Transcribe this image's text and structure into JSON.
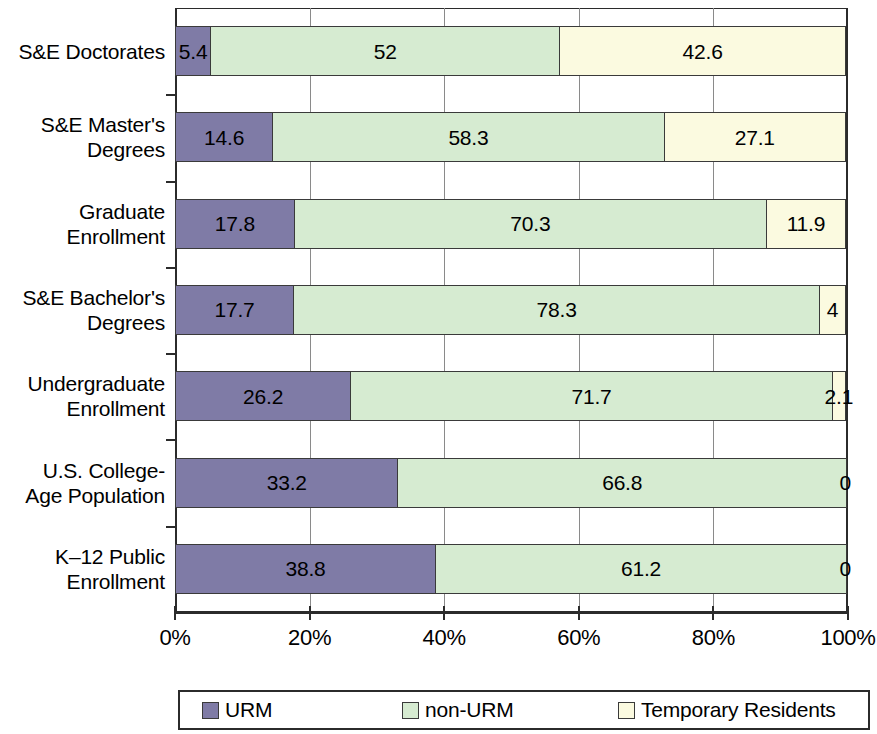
{
  "chart_data": {
    "type": "bar",
    "orientation": "horizontal",
    "stacked": true,
    "stacked_percent": true,
    "title": "",
    "subtitle": "",
    "xlabel": "",
    "ylabel": "",
    "xlim": [
      0,
      100
    ],
    "xticks": [
      0,
      20,
      40,
      60,
      80,
      100
    ],
    "xtick_labels": [
      "0%",
      "20%",
      "40%",
      "60%",
      "80%",
      "100%"
    ],
    "grid": true,
    "grid_axis": "x",
    "legend_position": "bottom",
    "categories": [
      "S&E Doctorates",
      "S&E Master's Degrees",
      "Graduate Enrollment",
      "S&E Bachelor's Degrees",
      "Undergraduate Enrollment",
      "U.S. College-Age Population",
      "K–12 Public Enrollment"
    ],
    "category_label_lines": [
      [
        "S&E Doctorates"
      ],
      [
        "S&E Master's",
        "Degrees"
      ],
      [
        "Graduate",
        "Enrollment"
      ],
      [
        "S&E Bachelor's",
        "Degrees"
      ],
      [
        "Undergraduate",
        "Enrollment"
      ],
      [
        "U.S. College-",
        "Age Population"
      ],
      [
        "K–12 Public",
        "Enrollment"
      ]
    ],
    "series": [
      {
        "name": "URM",
        "color": "#7f7ba6",
        "values": [
          5.4,
          14.6,
          17.8,
          17.7,
          26.2,
          33.2,
          38.8
        ],
        "labels": [
          "5.4",
          "14.6",
          "17.8",
          "17.7",
          "26.2",
          "33.2",
          "38.8"
        ]
      },
      {
        "name": "non-URM",
        "color": "#d6ebd1",
        "values": [
          52,
          58.3,
          70.3,
          78.3,
          71.7,
          66.8,
          61.2
        ],
        "labels": [
          "52",
          "58.3",
          "70.3",
          "78.3",
          "71.7",
          "66.8",
          "61.2"
        ]
      },
      {
        "name": "Temporary Residents",
        "color": "#fbfae0",
        "values": [
          42.6,
          27.1,
          11.9,
          4,
          2.1,
          0,
          0
        ],
        "labels": [
          "42.6",
          "27.1",
          "11.9",
          "4",
          "2.1",
          "0",
          "0"
        ]
      }
    ]
  },
  "legend": {
    "items": [
      {
        "label": "URM",
        "color": "#7f7ba6"
      },
      {
        "label": "non-URM",
        "color": "#d6ebd1"
      },
      {
        "label": "Temporary Residents",
        "color": "#fbfae0"
      }
    ]
  },
  "colors": {
    "urm": "#7f7ba6",
    "non_urm": "#d6ebd1",
    "temporary_residents": "#fbfae0",
    "axis": "#2b2b2b",
    "gridline": "#8a8a8a",
    "background": "#ffffff"
  }
}
